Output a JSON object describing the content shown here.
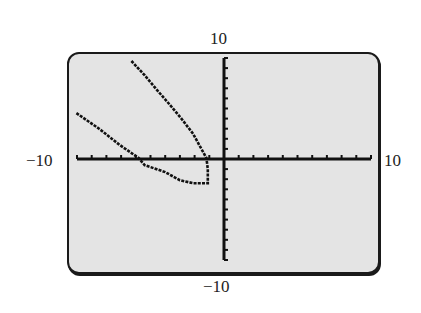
{
  "window": {
    "xmin_label": "−10",
    "xmax_label": "10",
    "ymax_label": "10",
    "ymin_label": "−10"
  },
  "colors": {
    "screen_bg": "#e4e4e4",
    "axis": "#111111",
    "curve": "#111111",
    "frame": "#1a1a1a"
  },
  "chart_data": {
    "type": "line",
    "title": "",
    "xlabel": "",
    "ylabel": "",
    "xlim": [
      -10,
      10
    ],
    "ylim": [
      -10,
      10
    ],
    "xscl": 1,
    "yscl": 1,
    "grid": false,
    "legend": null,
    "tick_labels": {
      "x": [
        "−10",
        "10"
      ],
      "y": [
        "−10",
        "10"
      ]
    },
    "series": [
      {
        "name": "relation (sideways conic, opening left)",
        "points": [
          [
            -6.3,
            9.7
          ],
          [
            -5.4,
            8.3
          ],
          [
            -4.6,
            6.9
          ],
          [
            -3.7,
            5.4
          ],
          [
            -2.9,
            4.0
          ],
          [
            -2.1,
            2.5
          ],
          [
            -1.2,
            0.1
          ],
          [
            -1.1,
            -1.0
          ],
          [
            -1.1,
            -2.4
          ],
          [
            -2.1,
            -2.4
          ],
          [
            -3.0,
            -2.1
          ],
          [
            -4.0,
            -1.3
          ],
          [
            -5.4,
            -0.6
          ],
          [
            -5.8,
            0.1
          ],
          [
            -7.1,
            1.4
          ],
          [
            -8.5,
            3.0
          ],
          [
            -10.1,
            4.6
          ]
        ]
      }
    ]
  }
}
